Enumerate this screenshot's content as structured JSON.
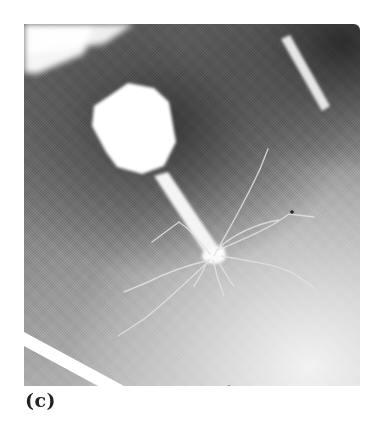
{
  "figure": {
    "panel_label": "(c)",
    "colors": {
      "background": "#ffffff",
      "label": "#222222",
      "dark_region": "#3a3a3a",
      "light_region": "#e8e8e8",
      "phage_highlight": "#ffffff"
    }
  }
}
